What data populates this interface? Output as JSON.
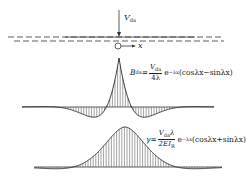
{
  "diagram": {
    "load": {
      "symbol": "V",
      "subscript": "da"
    },
    "axis": {
      "label": "x"
    },
    "formula_B": {
      "lhs": "B",
      "lhs_sub": "da",
      "equals": "=",
      "num": "V",
      "num_sub": "da",
      "den": "4λ",
      "exp_base": "e",
      "exp_power": "−λx",
      "trig": "(cosλx−sinλx)"
    },
    "formula_gamma": {
      "lhs": "γ",
      "equals": "=",
      "num": "V",
      "num_sub": "da",
      "num_tail": "λ",
      "den": "2EI",
      "den_sub": "R",
      "exp_base": "e",
      "exp_power": "−λx",
      "trig": "(cosλx+sinλx)"
    },
    "colors": {
      "line": "#222222",
      "background": "#ffffff"
    }
  }
}
